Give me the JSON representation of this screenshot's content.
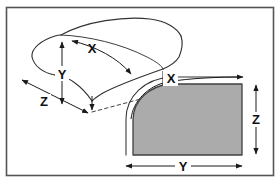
{
  "figure": {
    "frame": {
      "border_color": "#555555",
      "background_color": "#ffffff"
    },
    "colors": {
      "outline": "#333333",
      "fill_gray": "#ababab",
      "fill_gray_outline": "#404040",
      "arrow": "#1a1a1a",
      "label": "#111111",
      "hidden_edge": "#444444"
    },
    "views": [
      {
        "name": "three-dimensional-curved-panel",
        "description": "perspective view of curved panel",
        "dimensions": [
          {
            "id": "x-3d",
            "label": "X",
            "style": "curved-double-arrow",
            "x": 92,
            "y": 53
          },
          {
            "id": "y-3d",
            "label": "Y",
            "style": "vertical-double-arrow",
            "x": 62,
            "y": 74
          },
          {
            "id": "z-3d",
            "label": "Z",
            "style": "diagonal-double-arrow",
            "x": 44,
            "y": 103
          }
        ]
      },
      {
        "name": "flattened-developed-panel",
        "description": "flat developed view of panel, gray filled",
        "dimensions": [
          {
            "id": "x-flat",
            "label": "X",
            "style": "curved-double-arrow",
            "x": 171,
            "y": 82
          },
          {
            "id": "z-flat",
            "label": "Z",
            "style": "vertical-double-arrow",
            "x": 256,
            "y": 117
          },
          {
            "id": "y-flat",
            "label": "Y",
            "style": "horizontal-double-arrow",
            "x": 183,
            "y": 166
          }
        ]
      }
    ]
  }
}
